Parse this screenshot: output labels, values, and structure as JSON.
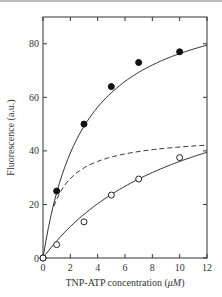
{
  "chart_data": {
    "type": "scatter",
    "title": "",
    "xlabel": "TNP-ATP concentration (μM)",
    "ylabel": "Fluorescence (a.u.)",
    "xlim": [
      0,
      12
    ],
    "ylim": [
      0,
      90
    ],
    "xticks": [
      0,
      2,
      4,
      6,
      8,
      10,
      12
    ],
    "yticks": [
      0,
      20,
      40,
      60,
      80
    ],
    "grid": false,
    "legend": null,
    "series": [
      {
        "name": "filled circles",
        "marker": "filled-circle",
        "x": [
          0,
          1,
          3,
          5,
          7,
          10
        ],
        "y": [
          0,
          25,
          50,
          64,
          73,
          77
        ],
        "fit_line": "solid"
      },
      {
        "name": "open circles",
        "marker": "open-circle",
        "x": [
          0,
          1,
          3,
          5,
          7,
          10
        ],
        "y": [
          0,
          5,
          13.5,
          23.5,
          29.5,
          37.5
        ],
        "fit_line": "solid"
      },
      {
        "name": "difference curve",
        "marker": "none",
        "line": "dashed",
        "x": [
          0,
          1,
          2,
          3,
          4,
          5,
          6,
          8,
          10,
          12
        ],
        "y": [
          0,
          22,
          30,
          34,
          36.5,
          38,
          39,
          40.5,
          41.5,
          42
        ]
      }
    ]
  },
  "axes": {
    "x_tick_labels": [
      "0",
      "2",
      "4",
      "6",
      "8",
      "10",
      "12"
    ],
    "y_tick_labels": [
      "0",
      "20",
      "40",
      "60",
      "80"
    ],
    "x_label_prefix": "TNP-ATP concentration (",
    "x_label_unit": "μM",
    "x_label_suffix": ")",
    "y_label": "Fluorescence (a.u.)"
  }
}
